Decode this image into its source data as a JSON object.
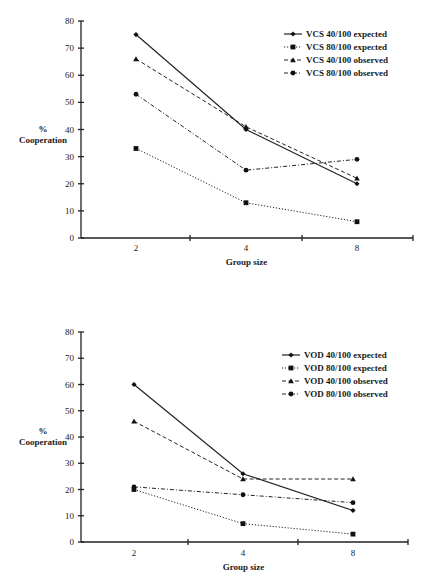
{
  "chart_data": [
    {
      "type": "line",
      "title": "",
      "xlabel": "Group size",
      "ylabel": "% Cooperation",
      "ylabel_lines": [
        "%",
        "Cooperation"
      ],
      "categories": [
        "2",
        "4",
        "8"
      ],
      "ylim": [
        0,
        80
      ],
      "yticks": [
        0,
        10,
        20,
        30,
        40,
        50,
        60,
        70,
        80
      ],
      "grid": false,
      "legend_position": "top-right",
      "series": [
        {
          "name": "VCS 40/100 expected",
          "values": [
            75,
            40,
            20
          ],
          "line_style": "solid",
          "marker": "diamond"
        },
        {
          "name": "VCS 80/100 expected",
          "values": [
            33,
            13,
            6
          ],
          "line_style": "dotted",
          "marker": "square"
        },
        {
          "name": "VCS 40/100 observed",
          "values": [
            66,
            41,
            22
          ],
          "line_style": "dashed",
          "marker": "triangle"
        },
        {
          "name": "VCS 80/100 observed",
          "values": [
            53,
            25,
            29
          ],
          "line_style": "dash-dot",
          "marker": "circle"
        }
      ]
    },
    {
      "type": "line",
      "title": "",
      "xlabel": "Group size",
      "ylabel": "% Cooperation",
      "ylabel_lines": [
        "%",
        "Cooperation"
      ],
      "categories": [
        "2",
        "4",
        "8"
      ],
      "ylim": [
        0,
        80
      ],
      "yticks": [
        0,
        10,
        20,
        30,
        40,
        50,
        60,
        70,
        80
      ],
      "grid": false,
      "legend_position": "top-right",
      "series": [
        {
          "name": "VOD 40/100 expected",
          "values": [
            60,
            26,
            12
          ],
          "line_style": "solid",
          "marker": "diamond"
        },
        {
          "name": "VOD 80/100 expected",
          "values": [
            20,
            7,
            3
          ],
          "line_style": "dotted",
          "marker": "square"
        },
        {
          "name": "VOD 40/100 observed",
          "values": [
            46,
            24,
            24
          ],
          "line_style": "dashed",
          "marker": "triangle"
        },
        {
          "name": "VOD 80/100 observed",
          "values": [
            21,
            18,
            15
          ],
          "line_style": "dash-dot",
          "marker": "circle"
        }
      ]
    }
  ]
}
